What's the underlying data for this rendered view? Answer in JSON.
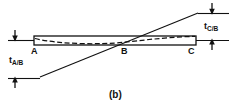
{
  "figure": {
    "caption": "(b)",
    "colors": {
      "ink": "#111111",
      "beam_outline": "#111111",
      "tangent_line": "#111111",
      "deflection_curve": "#111111",
      "background": "#ffffff"
    },
    "points": [
      {
        "id": "A",
        "label": "A",
        "x": 34,
        "y": 52
      },
      {
        "id": "B",
        "label": "B",
        "x": 124,
        "y": 52
      },
      {
        "id": "C",
        "label": "C",
        "x": 191,
        "y": 52
      }
    ],
    "dimensions": [
      {
        "id": "t-a-over-b",
        "symbol": "t",
        "subscript": "A/B",
        "label": "tA/B",
        "side": "left",
        "x": 10,
        "y": 56
      },
      {
        "id": "t-c-over-b",
        "symbol": "t",
        "subscript": "C/B",
        "label": "tC/B",
        "side": "right",
        "x": 205,
        "y": 22
      }
    ],
    "beam": {
      "left_x": 34,
      "right_x": 196,
      "top_y": 36,
      "bottom_y": 45
    },
    "tangent": {
      "x1": 40,
      "y1": 77,
      "x2": 198,
      "y2": 13
    }
  }
}
